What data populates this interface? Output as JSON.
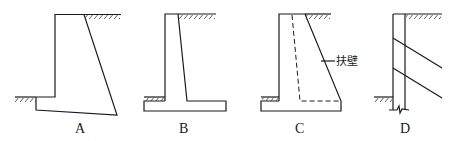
{
  "figure": {
    "panels": [
      {
        "id": "A",
        "label": "A",
        "type": "gravity-retaining-wall"
      },
      {
        "id": "B",
        "label": "B",
        "type": "cantilever-retaining-wall"
      },
      {
        "id": "C",
        "label": "C",
        "type": "counterfort-retaining-wall",
        "annotation": "扶壁"
      },
      {
        "id": "D",
        "label": "D",
        "type": "anchored-retaining-wall"
      }
    ]
  },
  "labels": {
    "a": "A",
    "b": "B",
    "c": "C",
    "d": "D",
    "counterfort": "扶壁"
  },
  "colors": {
    "line": "#1a1a1a",
    "background": "#ffffff"
  }
}
